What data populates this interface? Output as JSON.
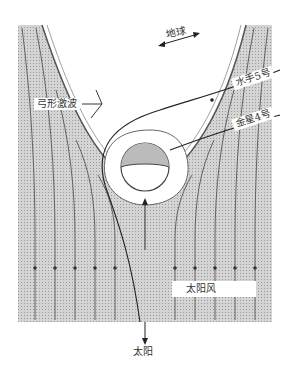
{
  "diagram": {
    "labels": {
      "earth": "地球",
      "bow_shock": "弓形激波",
      "mariner5": "水手5号",
      "venera4": "金星4号",
      "solar_wind": "太阳风",
      "sun": "太阳"
    },
    "colors": {
      "field": "#c9c9c9",
      "lines": "#444444",
      "background": "#ffffff"
    }
  }
}
